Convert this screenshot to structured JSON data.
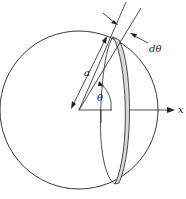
{
  "diagram": {
    "type": "sphere-slice-geometry",
    "labels": {
      "radius": "a",
      "angle": "θ",
      "angle_increment": "dθ",
      "axis": "x"
    },
    "colors": {
      "stroke": "#222222",
      "band_fill": "#d9d9d9",
      "background": "#ffffff"
    }
  }
}
